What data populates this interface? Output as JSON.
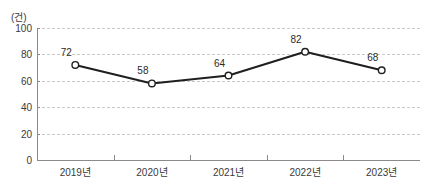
{
  "chart_data": {
    "type": "line",
    "title": "",
    "subtitle": "",
    "xlabel": "",
    "ylabel": "",
    "unit_label": "(건)",
    "categories": [
      "2019년",
      "2020년",
      "2021년",
      "2022년",
      "2023년"
    ],
    "values": [
      72,
      58,
      64,
      82,
      68
    ],
    "series": [
      {
        "name": "",
        "values": [
          72,
          58,
          64,
          82,
          68
        ]
      }
    ],
    "point_labels": [
      "72",
      "58",
      "64",
      "82",
      "68"
    ],
    "ylim": [
      0,
      100
    ],
    "ytick_values": [
      0,
      20,
      40,
      60,
      80,
      100
    ],
    "ytick_labels": [
      "0",
      "20",
      "40",
      "60",
      "80",
      "100"
    ],
    "grid": true,
    "grid_axis": "y",
    "grid_style": "dashed",
    "legend": false,
    "legend_position": "none",
    "colors": {
      "line": "#1f1f1f",
      "marker_fill": "#ffffff",
      "marker_stroke": "#1f1f1f",
      "gridline": "#c9c9c9",
      "axis": "#8a8a8a",
      "text": "#3a3a3a",
      "background": "#ffffff"
    }
  }
}
